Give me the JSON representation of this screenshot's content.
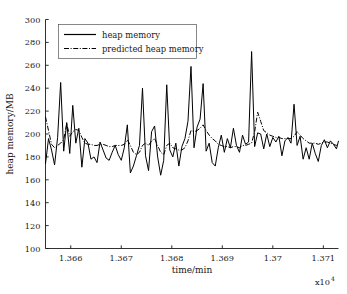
{
  "chart_data": {
    "type": "line",
    "title": "",
    "xlabel": "time/min",
    "ylabel": "heap memory/MB",
    "x_exponent_label": "x10",
    "x_exponent_power": "4",
    "xlim": [
      13655,
      13713
    ],
    "ylim": [
      100,
      300
    ],
    "xticks": [
      13660,
      13670,
      13680,
      13690,
      13700,
      13710
    ],
    "xtick_labels": [
      "1.366",
      "1.367",
      "1.368",
      "1.369",
      "1.37",
      "1.371"
    ],
    "yticks": [
      100,
      120,
      140,
      160,
      180,
      200,
      220,
      240,
      260,
      280,
      300
    ],
    "ytick_labels": [
      "100",
      "120",
      "140",
      "160",
      "180",
      "200",
      "220",
      "240",
      "260",
      "280",
      "300"
    ],
    "grid": false,
    "legend_position": "upper-left",
    "legend": [
      "heap memory",
      "predicted heap memory"
    ],
    "series": [
      {
        "name": "heap memory",
        "style": "solid",
        "color": "#000000",
        "x": [
          13655.0,
          13655.6,
          13656.2,
          13656.8,
          13657.4,
          13658.0,
          13658.6,
          13659.2,
          13659.8,
          13660.4,
          13661.0,
          13661.6,
          13662.2,
          13662.8,
          13663.4,
          13664.0,
          13664.6,
          13665.2,
          13665.8,
          13666.4,
          13667.0,
          13667.6,
          13668.2,
          13668.8,
          13669.4,
          13670.0,
          13670.6,
          13671.2,
          13671.8,
          13672.4,
          13673.0,
          13673.6,
          13674.2,
          13674.8,
          13675.4,
          13676.0,
          13676.6,
          13677.2,
          13677.8,
          13678.4,
          13679.0,
          13679.6,
          13680.2,
          13680.8,
          13681.4,
          13682.0,
          13682.6,
          13683.2,
          13683.8,
          13684.4,
          13685.0,
          13685.6,
          13686.2,
          13686.8,
          13687.4,
          13688.0,
          13688.6,
          13689.2,
          13689.8,
          13690.4,
          13691.0,
          13691.6,
          13692.2,
          13692.8,
          13693.4,
          13694.0,
          13694.6,
          13695.2,
          13695.8,
          13696.4,
          13697.0,
          13697.6,
          13698.2,
          13698.8,
          13699.4,
          13700.0,
          13700.6,
          13701.2,
          13701.8,
          13702.4,
          13703.0,
          13703.6,
          13704.2,
          13704.8,
          13705.4,
          13706.0,
          13706.6,
          13707.2,
          13707.8,
          13708.4,
          13709.0,
          13709.6,
          13710.2,
          13710.8,
          13711.4,
          13712.0,
          13712.6,
          13713.0
        ],
        "values": [
          174,
          196,
          186,
          173,
          197,
          245,
          185,
          210,
          183,
          225,
          192,
          205,
          171,
          196,
          192,
          178,
          180,
          175,
          193,
          186,
          179,
          177,
          184,
          190,
          182,
          177,
          188,
          208,
          166,
          172,
          181,
          190,
          240,
          181,
          168,
          202,
          207,
          180,
          164,
          177,
          243,
          186,
          180,
          192,
          172,
          189,
          196,
          211,
          259,
          188,
          206,
          213,
          244,
          185,
          192,
          175,
          172,
          188,
          199,
          184,
          196,
          188,
          205,
          190,
          184,
          199,
          191,
          193,
          272,
          189,
          201,
          200,
          187,
          200,
          189,
          197,
          193,
          198,
          181,
          194,
          197,
          192,
          226,
          190,
          198,
          178,
          188,
          178,
          192,
          183,
          176,
          190,
          195,
          188,
          194,
          191,
          187,
          194
        ]
      },
      {
        "name": "predicted heap memory",
        "style": "dash-dot",
        "color": "#000000",
        "x": [
          13655.0,
          13655.6,
          13656.2,
          13656.8,
          13657.4,
          13658.0,
          13658.6,
          13659.2,
          13659.8,
          13660.4,
          13661.0,
          13661.6,
          13662.2,
          13662.8,
          13663.4,
          13664.0,
          13664.6,
          13665.2,
          13665.8,
          13666.4,
          13667.0,
          13667.6,
          13668.2,
          13668.8,
          13669.4,
          13670.0,
          13670.6,
          13671.2,
          13671.8,
          13672.4,
          13673.0,
          13673.6,
          13674.2,
          13674.8,
          13675.4,
          13676.0,
          13676.6,
          13677.2,
          13677.8,
          13678.4,
          13679.0,
          13679.6,
          13680.2,
          13680.8,
          13681.4,
          13682.0,
          13682.6,
          13683.2,
          13683.8,
          13684.4,
          13685.0,
          13685.6,
          13686.2,
          13686.8,
          13687.4,
          13688.0,
          13688.6,
          13689.2,
          13689.8,
          13690.4,
          13691.0,
          13691.6,
          13692.2,
          13692.8,
          13693.4,
          13694.0,
          13694.6,
          13695.2,
          13695.8,
          13696.4,
          13697.0,
          13697.6,
          13698.2,
          13698.8,
          13699.4,
          13700.0,
          13700.6,
          13701.2,
          13701.8,
          13702.4,
          13703.0,
          13703.6,
          13704.2,
          13704.8,
          13705.4,
          13706.0,
          13706.6,
          13707.2,
          13707.8,
          13708.4,
          13709.0,
          13709.6,
          13710.2,
          13710.8,
          13711.4,
          13712.0,
          13712.6,
          13713.0
        ],
        "values": [
          215,
          203,
          191,
          188,
          190,
          192,
          195,
          209,
          198,
          202,
          204,
          203,
          197,
          192,
          191,
          191,
          190,
          190,
          191,
          191,
          190,
          189,
          189,
          190,
          190,
          190,
          191,
          195,
          190,
          184,
          182,
          184,
          190,
          192,
          190,
          194,
          196,
          190,
          184,
          182,
          190,
          192,
          188,
          187,
          186,
          186,
          188,
          194,
          203,
          202,
          203,
          205,
          208,
          203,
          199,
          196,
          194,
          191,
          190,
          189,
          189,
          188,
          189,
          189,
          188,
          190,
          190,
          191,
          192,
          202,
          219,
          211,
          203,
          201,
          199,
          198,
          197,
          197,
          196,
          196,
          196,
          196,
          198,
          202,
          199,
          196,
          194,
          192,
          192,
          192,
          191,
          192,
          193,
          193,
          192,
          191,
          190,
          192
        ]
      }
    ]
  },
  "legend": {
    "entries": [
      {
        "label": "heap memory",
        "style": "solid"
      },
      {
        "label": "predicted heap memory",
        "style": "dash-dot"
      }
    ]
  },
  "axes": {
    "x_title": "time/min",
    "y_title": "heap memory/MB",
    "x_exponent": "x10",
    "x_exponent_power": "4"
  }
}
